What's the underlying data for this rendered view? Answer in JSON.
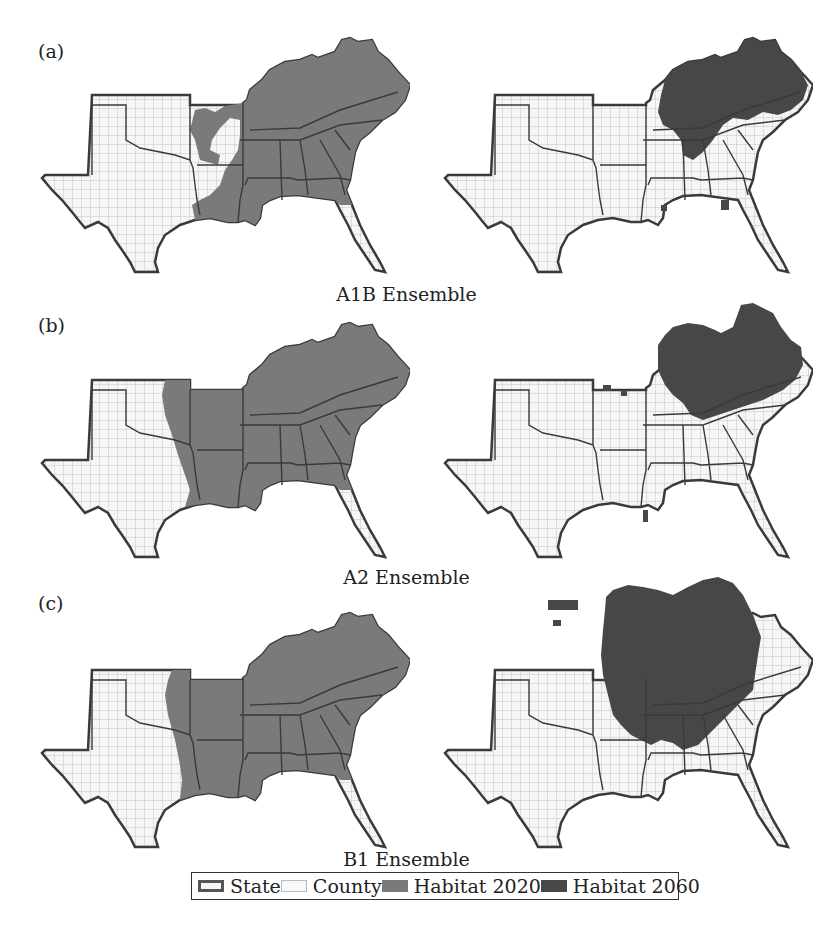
{
  "figure": {
    "panels": [
      {
        "label": "(a)",
        "scenario": "A1B Ensemble"
      },
      {
        "label": "(b)",
        "scenario": "A2 Ensemble"
      },
      {
        "label": "(c)",
        "scenario": "B1 Ensemble"
      }
    ],
    "legend": {
      "items": [
        {
          "label": "State",
          "swatch": "state-outline"
        },
        {
          "label": "County",
          "swatch": "county-outline"
        },
        {
          "label": "Habitat 2020",
          "swatch": "habitat-2020"
        },
        {
          "label": "Habitat 2060",
          "swatch": "habitat-2060"
        }
      ]
    },
    "colors": {
      "habitat_2020": "#7a7a7a",
      "habitat_2060": "#474747",
      "county_fill": "#f6f6f6",
      "county_line": "#c4c4c4",
      "state_line": "#3a3a3a"
    }
  }
}
